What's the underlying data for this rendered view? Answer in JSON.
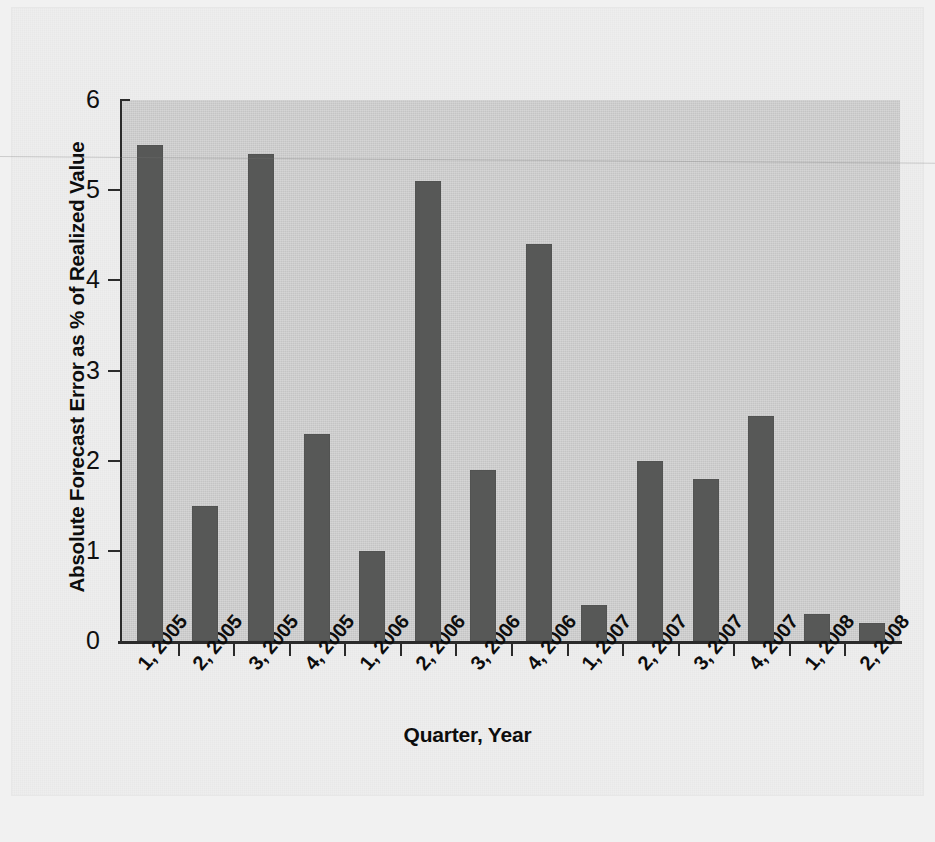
{
  "chart_data": {
    "type": "bar",
    "title": "",
    "subtitle": "",
    "xlabel": "Quarter, Year",
    "ylabel": "Absolute Forecast Error as % of Realized Value",
    "categories": [
      "1, 2005",
      "2, 2005",
      "3, 2005",
      "4, 2005",
      "1, 2006",
      "2, 2006",
      "3, 2006",
      "4, 2006",
      "1, 2007",
      "2, 2007",
      "3, 2007",
      "4, 2007",
      "1, 2008",
      "2, 2008"
    ],
    "values": [
      5.5,
      1.5,
      5.4,
      2.3,
      1.0,
      5.1,
      1.9,
      4.4,
      0.4,
      2.0,
      1.8,
      2.5,
      0.3,
      0.2
    ],
    "ylim": [
      0,
      6
    ],
    "yticks": [
      0,
      1,
      2,
      3,
      4,
      5,
      6
    ],
    "ytick_labels": [
      "0",
      "1",
      "2",
      "3",
      "4",
      "5",
      "6"
    ],
    "xlim_categories": 14,
    "grid": false,
    "legend": null,
    "legend_position": "none",
    "annotations": [],
    "bar_color": "#575857",
    "plot_background": "#d2d2d2",
    "page_background": "#eeeeee",
    "axis_color": "#2b2b2b",
    "text_color": "#0d0d0d"
  }
}
